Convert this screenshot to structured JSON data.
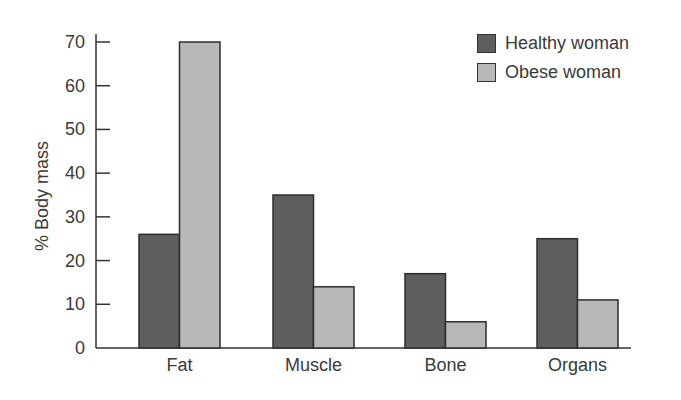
{
  "chart_data": {
    "type": "bar",
    "title": "",
    "xlabel": "",
    "ylabel": "% Body mass",
    "ylim": [
      0,
      70
    ],
    "yticks": [
      0,
      10,
      20,
      30,
      40,
      50,
      60,
      70
    ],
    "grid": false,
    "legend_position": "top-right",
    "categories": [
      "Fat",
      "Muscle",
      "Bone",
      "Organs"
    ],
    "series": [
      {
        "name": "Healthy woman",
        "color": "#5e5e5e",
        "values": [
          26,
          35,
          17,
          25
        ]
      },
      {
        "name": "Obese woman",
        "color": "#b8b8b8",
        "values": [
          70,
          14,
          6,
          11
        ]
      }
    ]
  }
}
